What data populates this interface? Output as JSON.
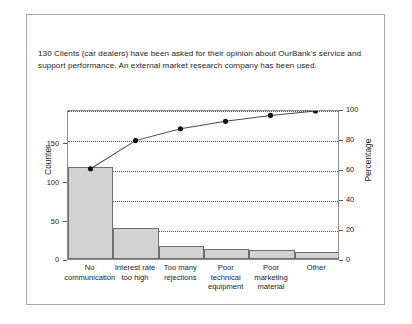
{
  "caption": {
    "text": "130 Clients (car dealers) have been asked for their opinion about OurBank's service and support performance. An external market research company has been used."
  },
  "chart_data": {
    "type": "bar",
    "title": "",
    "subtitle": "",
    "categories": [
      "No\ncommunication",
      "Interest rate\ntoo high",
      "Too many\nrejections",
      "Poor\ntechnical\nequipment",
      "Poor\nmarketing\nmaterial",
      "Other"
    ],
    "series": [
      {
        "name": "Counter",
        "type": "bar",
        "values": [
          118,
          40,
          17,
          13,
          11,
          9
        ],
        "axis": "left"
      },
      {
        "name": "Cumulative percentage",
        "type": "line",
        "values": [
          61,
          80,
          88,
          93,
          97,
          100
        ],
        "axis": "right"
      }
    ],
    "xlabel": "",
    "ylabel": "Counter",
    "y2label": "Percentage",
    "ylim": [
      0,
      193
    ],
    "y2lim": [
      0,
      100
    ],
    "yticks": [
      0,
      50,
      100,
      150
    ],
    "y2ticks": [
      0,
      20,
      40,
      60,
      80,
      100
    ],
    "ytick_labels": [
      "0",
      "50",
      "100",
      "150"
    ],
    "y2tick_labels": [
      "0",
      "20",
      "40",
      "60",
      "80",
      "100"
    ],
    "grid": true,
    "grid_axis": "y2",
    "legend": "none",
    "bar_color": "#d2d2d2",
    "bar_edge_color": "#6e6e6e",
    "line_color": "#4a4a4a",
    "marker_color": "#111111"
  },
  "colors": {
    "border": "#a8a8a8",
    "axis": "#8d8d8d",
    "text": "#1c1c1c",
    "background": "#ffffff"
  }
}
